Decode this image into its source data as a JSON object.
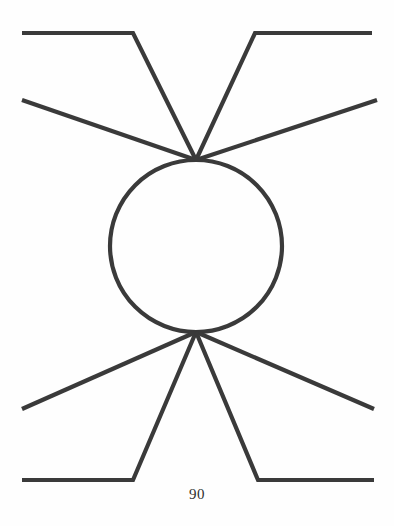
{
  "figure": {
    "caption": "90",
    "background_color": "#fefefe",
    "stroke_color": "#3a3a3a",
    "stroke_width": 4.2,
    "width": 394,
    "height": 526
  },
  "chart_data": {
    "type": "diagram",
    "title": "",
    "canvas": {
      "width": 394,
      "height": 526
    },
    "loop": {
      "center_x": 196,
      "center_y": 246,
      "radius": 86
    },
    "vertices": [
      {
        "name": "top-vertex",
        "x": 196,
        "y": 160
      },
      {
        "name": "bottom-vertex",
        "x": 196,
        "y": 332
      }
    ],
    "legs": [
      {
        "name": "upper-left-outer-leg",
        "points": [
          [
            22,
            33
          ],
          [
            133,
            33
          ],
          [
            196,
            160
          ]
        ]
      },
      {
        "name": "upper-left-inner-leg",
        "points": [
          [
            22,
            100
          ],
          [
            196,
            160
          ]
        ]
      },
      {
        "name": "upper-right-outer-leg",
        "points": [
          [
            372,
            33
          ],
          [
            255,
            33
          ],
          [
            196,
            160
          ]
        ]
      },
      {
        "name": "upper-right-inner-leg",
        "points": [
          [
            377,
            100
          ],
          [
            196,
            160
          ]
        ]
      },
      {
        "name": "lower-left-inner-leg",
        "points": [
          [
            22,
            409
          ],
          [
            196,
            332
          ]
        ]
      },
      {
        "name": "lower-left-outer-leg",
        "points": [
          [
            22,
            480
          ],
          [
            133,
            480
          ],
          [
            196,
            332
          ]
        ]
      },
      {
        "name": "lower-right-inner-leg",
        "points": [
          [
            374,
            409
          ],
          [
            196,
            332
          ]
        ]
      },
      {
        "name": "lower-right-outer-leg",
        "points": [
          [
            374,
            480
          ],
          [
            258,
            480
          ],
          [
            196,
            332
          ]
        ]
      }
    ],
    "annotations": [
      {
        "name": "page-number",
        "text": "90",
        "x": 196,
        "y": 496
      }
    ]
  }
}
